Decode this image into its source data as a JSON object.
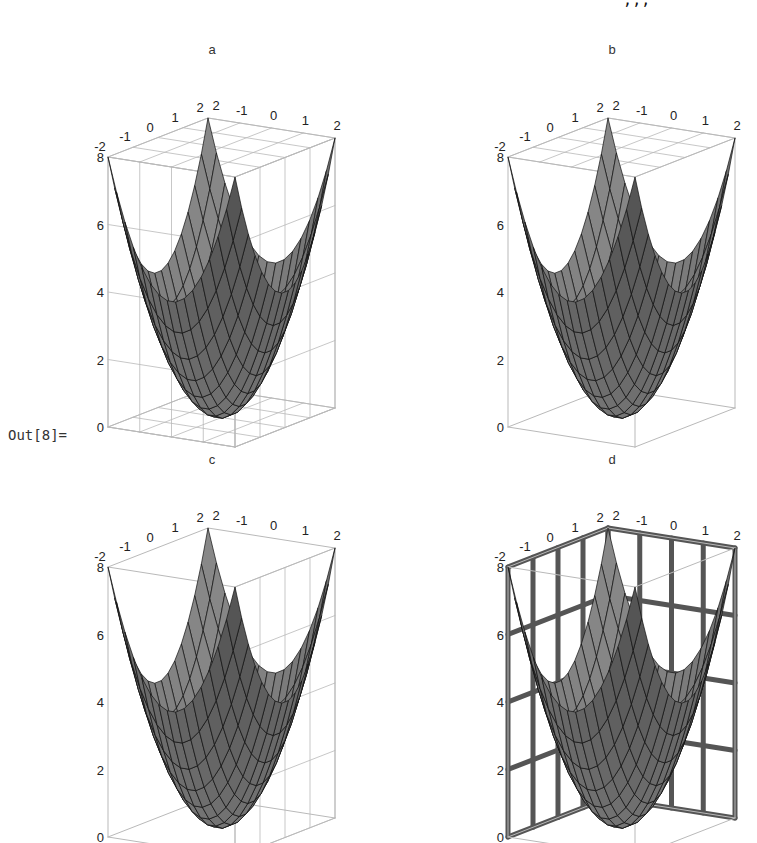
{
  "notebook": {
    "input_fragment": "                                                                     ,,,                     ]",
    "output_label": "Out[8]="
  },
  "chart_data": [
    {
      "type": "surface3d",
      "title": "a",
      "function": "x^2 + y^2",
      "x_range": [
        -2,
        2
      ],
      "y_range": [
        -2,
        2
      ],
      "z_range": [
        0,
        8
      ],
      "x_ticks": [
        "-2",
        "-1",
        "0",
        "1",
        "2"
      ],
      "y_ticks": [
        "2",
        "-1",
        "0",
        "1",
        "2"
      ],
      "z_ticks": [
        "0",
        "2",
        "4",
        "6",
        "8"
      ],
      "face_grids": "all",
      "face_grid_style": "thin-gray",
      "mesh": 15
    },
    {
      "type": "surface3d",
      "title": "b",
      "function": "x^2 + y^2",
      "x_range": [
        -2,
        2
      ],
      "y_range": [
        -2,
        2
      ],
      "z_range": [
        0,
        8
      ],
      "x_ticks": [
        "-2",
        "-1",
        "0",
        "1",
        "2"
      ],
      "y_ticks": [
        "2",
        "-1",
        "0",
        "1",
        "2"
      ],
      "z_ticks": [
        "0",
        "2",
        "4",
        "6",
        "8"
      ],
      "face_grids": "top",
      "face_grid_style": "thin-gray",
      "mesh": 15
    },
    {
      "type": "surface3d",
      "title": "c",
      "function": "x^2 + y^2",
      "x_range": [
        -2,
        2
      ],
      "y_range": [
        -2,
        2
      ],
      "z_range": [
        0,
        8
      ],
      "x_ticks": [
        "-2",
        "-1",
        "0",
        "1",
        "2"
      ],
      "y_ticks": [
        "2",
        "-1",
        "0",
        "1",
        "2"
      ],
      "z_ticks": [
        "0",
        "2",
        "4",
        "6",
        "8"
      ],
      "face_grids": "right",
      "face_grid_style": "thin-gray",
      "mesh": 15
    },
    {
      "type": "surface3d",
      "title": "d",
      "function": "x^2 + y^2",
      "x_range": [
        -2,
        2
      ],
      "y_range": [
        -2,
        2
      ],
      "z_range": [
        0,
        8
      ],
      "x_ticks": [
        "-2",
        "-1",
        "0",
        "1",
        "2"
      ],
      "y_ticks": [
        "2",
        "-1",
        "0",
        "1",
        "2"
      ],
      "z_ticks": [
        "0",
        "2",
        "4",
        "6",
        "8"
      ],
      "face_grids": "back-left-and-back-right",
      "face_grid_style": "thick-dark",
      "mesh": 15
    }
  ],
  "colors": {
    "surface_light": "#8a8a8a",
    "surface_dark": "#3c3c3c",
    "mesh_line": "#111111",
    "box_line": "#b9b9b9",
    "thick_grid": "#555555"
  }
}
